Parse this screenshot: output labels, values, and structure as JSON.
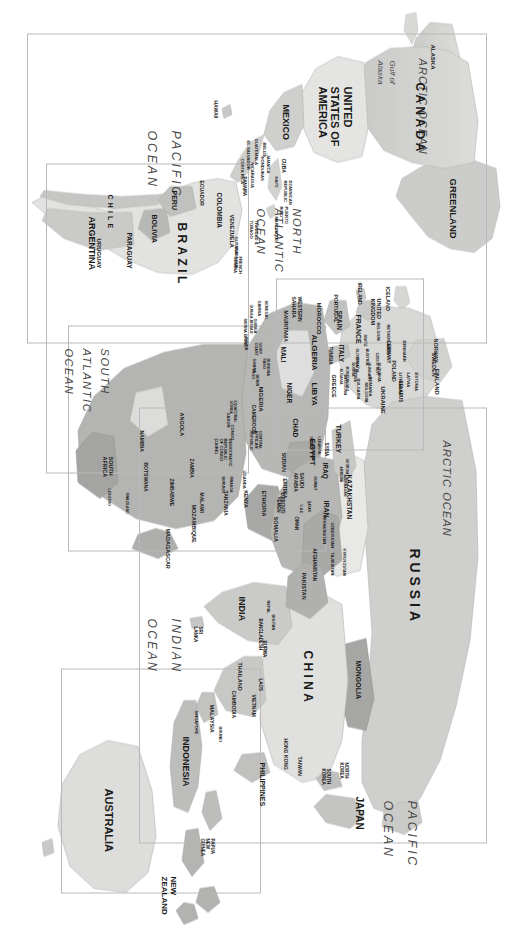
{
  "document": {
    "type": "world-political-map",
    "orientation": "rotated-90-clockwise",
    "background_color": "#ffffff",
    "land_color": "#d4d4d2",
    "highlight_color": "#a9a9a7",
    "frame_color": "#b9b9b9",
    "label_color": "#1a1a1a",
    "ocean_label_color": "#4a4a4a"
  },
  "oceans": [
    {
      "name": "ARCTIC OCEAN"
    },
    {
      "name": "ARCTIC OCEAN"
    },
    {
      "name": "PACIFIC OCEAN"
    },
    {
      "name": "PACIFIC OCEAN"
    },
    {
      "name": "INDIAN OCEAN"
    },
    {
      "name": "NORTH ATLANTIC OCEAN"
    },
    {
      "name": "SOUTH ATLANTIC OCEAN"
    }
  ],
  "ocean_labels": {
    "arctic_north_america": "ARCTIC OCEAN",
    "arctic_eurasia": "ARCTIC OCEAN",
    "pacific_east": "PACIFIC OCEAN",
    "pacific_west": "PACIFIC OCEAN",
    "indian": "INDIAN OCEAN",
    "north_atlantic": "NORTH ATLANTIC OCEAN",
    "south_atlantic": "SOUTH ATLANTIC OCEAN"
  },
  "water_features": [
    {
      "name": "Gulf of Alaska"
    }
  ],
  "frames": [
    {
      "name": "asia-frame",
      "label": "Asia inset frame"
    },
    {
      "name": "oceania-frame",
      "label": "Australia / New Zealand inset frame"
    },
    {
      "name": "africa-frame",
      "label": "Africa inset frame"
    },
    {
      "name": "europe-frame",
      "label": "Europe inset frame"
    },
    {
      "name": "north-america-frame",
      "label": "North America inset frame"
    },
    {
      "name": "south-america-frame",
      "label": "South America inset frame"
    }
  ],
  "regions": {
    "north_america": {
      "title": "North America",
      "countries": [
        "ALASKA",
        "CANADA",
        "UNITED STATES OF AMERICA",
        "MEXICO",
        "GREENLAND",
        "HAWAII",
        "CUBA",
        "DOMINICAN REPUBLIC",
        "HAITI",
        "PUERTO RICO",
        "JAMAICA",
        "BELIZE",
        "GUATEMALA",
        "HONDURAS",
        "EL SALVADOR",
        "NICARAGUA",
        "COSTA RICA",
        "PANAMA",
        "TRINIDAD & TOBAGO",
        "MARTINIQUE"
      ]
    },
    "south_america": {
      "title": "South America",
      "countries": [
        "COLOMBIA",
        "VENEZUELA",
        "GUYANA",
        "SURINAME",
        "FRENCH GUIANA",
        "ECUADOR",
        "PERU",
        "BRAZIL",
        "BOLIVIA",
        "PARAGUAY",
        "URUGUAY",
        "ARGENTINA",
        "CHILE"
      ]
    },
    "europe": {
      "title": "Europe",
      "countries": [
        "ICELAND",
        "NORWAY",
        "SWEDEN",
        "FINLAND",
        "ESTONIA",
        "LATVIA",
        "LITHUANIA",
        "DENMARK",
        "UNITED KINGDOM",
        "IRELAND",
        "NETHERLANDS",
        "BELGIUM",
        "GERMANY",
        "POLAND",
        "BELARUS",
        "UKRAINE",
        "MOLDOVA",
        "CZECH REPUBLIC",
        "SLOVAKIA",
        "AUSTRIA",
        "SWITZERLAND",
        "FRANCE",
        "PORTUGAL",
        "SPAIN",
        "ITALY",
        "SLOVENIA",
        "CROATIA",
        "BOSNIA",
        "SERBIA",
        "MONTENEGRO",
        "ALBANIA",
        "MACEDONIA",
        "HUNGARY",
        "ROMANIA",
        "BULGARIA",
        "GREECE",
        "RUSSIA"
      ]
    },
    "africa": {
      "title": "Africa",
      "countries": [
        "MOROCCO",
        "WESTERN SAHARA",
        "ALGERIA",
        "TUNISIA",
        "LIBYA",
        "EGYPT",
        "MAURITANIA",
        "MALI",
        "NIGER",
        "CHAD",
        "SUDAN",
        "ERITREA",
        "DJIBOUTI",
        "ETHIOPIA",
        "SOMALIA",
        "SENEGAL",
        "GAMBIA",
        "GUINEA-BISSAU",
        "GUINEA",
        "SIERRA LEONE",
        "LIBERIA",
        "IVORY COAST",
        "BURKINA FASO",
        "GHANA",
        "TOGO",
        "BENIN",
        "NIGERIA",
        "CAMEROON",
        "EQUATORIAL GUINEA",
        "GABON",
        "CONGO",
        "CENTRAL AFRICAN REPUBLIC",
        "DEMOCRATIC REPUBLIC OF CONGO (ZAIRE)",
        "UGANDA",
        "KENYA",
        "RWANDA",
        "BURUNDI",
        "TANZANIA",
        "ANGOLA",
        "ZAMBIA",
        "MALAWI",
        "MOZAMBIQUE",
        "ZIMBABWE",
        "BOTSWANA",
        "NAMIBIA",
        "SOUTH AFRICA",
        "SWAZILAND",
        "LESOTHO",
        "MADAGASCAR"
      ]
    },
    "middle_east_central_asia": {
      "title": "Middle East & Central Asia",
      "countries": [
        "TURKEY",
        "SYRIA",
        "LEBANON",
        "ISRAEL",
        "JORDAN",
        "IRAQ",
        "IRAN",
        "KUWAIT",
        "SAUDI ARABIA",
        "QATAR",
        "UNITED ARAB EMIRATES",
        "OMAN",
        "YEMEN",
        "GEORGIA",
        "ARMENIA",
        "AZERBAIJAN",
        "KAZAKHSTAN",
        "UZBEKISTAN",
        "TURKMENISTAN",
        "KYRGYZSTAN",
        "TAJIKISTAN",
        "AFGHANISTAN",
        "PAKISTAN"
      ]
    },
    "asia": {
      "title": "Asia",
      "countries": [
        "RUSSIA",
        "MONGOLIA",
        "CHINA",
        "NORTH KOREA",
        "SOUTH KOREA",
        "JAPAN",
        "TAIWAN",
        "HONG KONG",
        "INDIA",
        "NEPAL",
        "BHUTAN",
        "BANGLADESH",
        "BURMA",
        "LAOS",
        "THAILAND",
        "VIETNAM",
        "CAMBODIA",
        "MALAYSIA",
        "SINGAPORE",
        "BRUNEI",
        "INDONESIA",
        "PHILIPPINES",
        "SRI LANKA"
      ]
    },
    "oceania": {
      "title": "Oceania",
      "countries": [
        "PAPUA NEW GUINEA",
        "AUSTRALIA",
        "NEW ZEALAND"
      ]
    }
  },
  "major_labels": [
    {
      "text": "RUSSIA",
      "style": "spaced-large"
    },
    {
      "text": "CHINA",
      "style": "spaced-large"
    },
    {
      "text": "INDIA",
      "style": "large"
    },
    {
      "text": "JAPAN",
      "style": "large"
    },
    {
      "text": "AUSTRALIA",
      "style": "large"
    },
    {
      "text": "NEW ZEALAND",
      "style": "medium"
    },
    {
      "text": "INDONESIA",
      "style": "medium"
    },
    {
      "text": "PHILIPPINES",
      "style": "medium"
    },
    {
      "text": "CANADA",
      "style": "spaced-large"
    },
    {
      "text": "UNITED STATES OF AMERICA",
      "style": "large"
    },
    {
      "text": "MEXICO",
      "style": "medium"
    },
    {
      "text": "GREENLAND",
      "style": "medium"
    },
    {
      "text": "BRAZIL",
      "style": "spaced-large"
    },
    {
      "text": "ARGENTINA",
      "style": "medium"
    },
    {
      "text": "CHILE",
      "style": "spaced"
    },
    {
      "text": "ALGERIA",
      "style": "medium"
    },
    {
      "text": "LIBYA",
      "style": "medium"
    },
    {
      "text": "EGYPT",
      "style": "medium"
    },
    {
      "text": "MONGOLIA",
      "style": "medium"
    },
    {
      "text": "KAZAKHSTAN",
      "style": "small"
    },
    {
      "text": "SOUTH AFRICA",
      "style": "small"
    }
  ]
}
